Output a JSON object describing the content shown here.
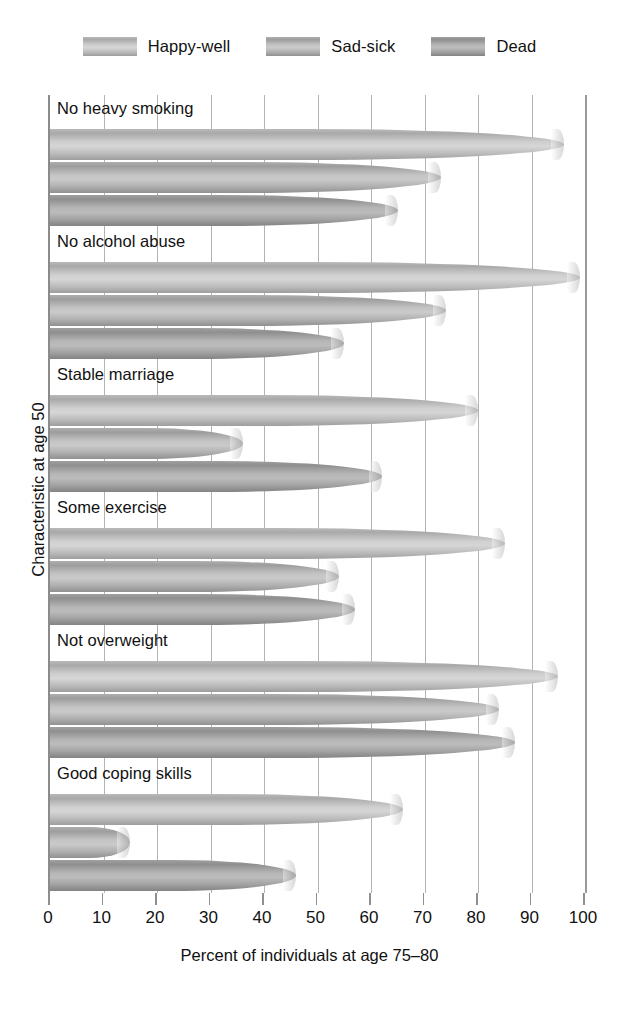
{
  "chart_data": {
    "type": "bar",
    "orientation": "horizontal",
    "title": "",
    "xlabel": "Percent of individuals at age 75–80",
    "ylabel": "Characteristic at age 50",
    "xlim": [
      0,
      100
    ],
    "xticks": [
      "0",
      "10",
      "20",
      "30",
      "40",
      "50",
      "60",
      "70",
      "80",
      "90",
      "100"
    ],
    "grid": true,
    "legend_position": "top-center",
    "categories": [
      "No heavy smoking",
      "No alcohol abuse",
      "Stable marriage",
      "Some exercise",
      "Not overweight",
      "Good coping skills"
    ],
    "series": [
      {
        "name": "Happy-well",
        "color": "#c3c3c3",
        "values": [
          96,
          99,
          80,
          85,
          95,
          66
        ]
      },
      {
        "name": "Sad-sick",
        "color": "#b6b6b6",
        "values": [
          73,
          74,
          36,
          54,
          84,
          15
        ]
      },
      {
        "name": "Dead",
        "color": "#a8a8a8",
        "values": [
          65,
          55,
          62,
          57,
          87,
          46
        ]
      }
    ]
  },
  "legend": {
    "items": [
      {
        "label": "Happy-well"
      },
      {
        "label": "Sad-sick"
      },
      {
        "label": "Dead"
      }
    ]
  },
  "axes": {
    "x_title": "Percent of individuals at age 75–80",
    "y_title": "Characteristic at age 50"
  }
}
